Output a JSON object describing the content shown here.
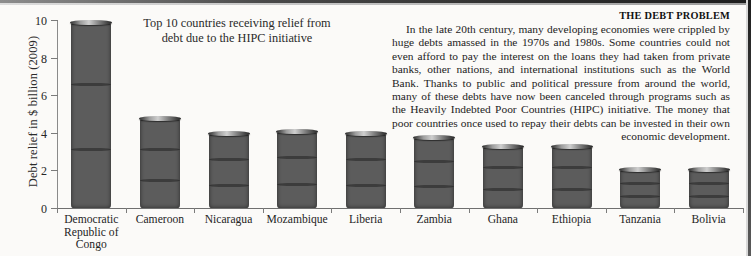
{
  "figure": {
    "title": "Top 10 countries receiving relief from debt due to the HIPC initiative",
    "title_line1": "Top 10 countries receiving relief from",
    "title_line2": "debt due to the HIPC initiative"
  },
  "article": {
    "heading": "THE DEBT PROBLEM",
    "body": "In the late 20th century, many developing economies were crippled by huge debts amassed in the 1970s and 1980s. Some countries could not even afford to pay the interest on the loans they had taken from private banks, other nations, and international institutions such as the World Bank. Thanks to public and political pressure from around the world, many of these debts have now been canceled through programs such as the Heavily Indebted Poor Countries (HIPC) initiative. The money that poor countries once used to repay their debts can be invested in their own economic development."
  },
  "axes": {
    "ylabel": "Debt relief in $ billion (2009)",
    "yticks": [
      "0",
      "2",
      "4",
      "6",
      "8",
      "10"
    ],
    "ylim": [
      0,
      10
    ]
  },
  "colors": {
    "page_background": "#fbfaf8",
    "text": "#242424",
    "axis": "#7b7b7b",
    "coin_dark": "#1b1b1b",
    "coin_light": "#cfcfcf"
  },
  "chart_data": {
    "type": "bar",
    "title": "Top 10 countries receiving relief from debt due to the HIPC initiative",
    "xlabel": "",
    "ylabel": "Debt relief in $ billion (2009)",
    "ylim": [
      0,
      10
    ],
    "yticks": [
      0,
      2,
      4,
      6,
      8,
      10
    ],
    "grid": false,
    "legend": "none",
    "unit": "$ billion (2009)",
    "bar_style": "stacked-coin-photograph",
    "categories": [
      "Democratic Republic of Congo",
      "Cameroon",
      "Nicaragua",
      "Mozambique",
      "Liberia",
      "Zambia",
      "Ghana",
      "Ethiopia",
      "Tanzania",
      "Bolivia"
    ],
    "category_lines": [
      [
        "Democratic",
        "Republic of",
        "Congo"
      ],
      [
        "Cameroon"
      ],
      [
        "Nicaragua"
      ],
      [
        "Mozambique"
      ],
      [
        "Liberia"
      ],
      [
        "Zambia"
      ],
      [
        "Ghana"
      ],
      [
        "Ethiopia"
      ],
      [
        "Tanzania"
      ],
      [
        "Bolivia"
      ]
    ],
    "values": [
      9.9,
      4.8,
      4.0,
      4.1,
      4.0,
      3.8,
      3.3,
      3.3,
      2.1,
      2.1
    ]
  }
}
